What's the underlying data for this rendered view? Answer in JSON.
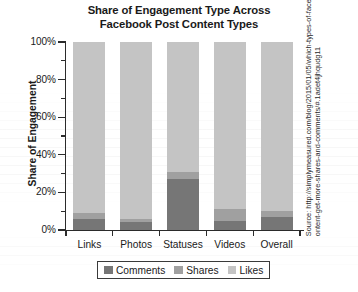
{
  "chart_data": {
    "type": "bar",
    "stacked": true,
    "title": "Share of Engagement Type Across Facebook Post Content Types",
    "title_lines": [
      "Share of Engagement Type Across",
      "Facebook Post Content Types"
    ],
    "xlabel": "",
    "ylabel": "Share of Engagement",
    "categories": [
      "Links",
      "Photos",
      "Statuses",
      "Videos",
      "Overall"
    ],
    "series": [
      {
        "name": "Comments",
        "color": "#767676",
        "values": [
          6,
          4,
          27,
          5,
          7
        ]
      },
      {
        "name": "Shares",
        "color": "#a0a0a0",
        "values": [
          3,
          2,
          4,
          6,
          3
        ]
      },
      {
        "name": "Likes",
        "color": "#c4c4c4",
        "values": [
          91,
          94,
          69,
          89,
          90
        ]
      }
    ],
    "ylim": [
      0,
      100
    ],
    "ytick_labels": [
      "0%",
      "20%",
      "40%",
      "60%",
      "80%",
      "100%"
    ],
    "ytick_values": [
      0,
      20,
      40,
      60,
      80,
      100
    ],
    "yminor_values": [
      10,
      30,
      50,
      70,
      90
    ],
    "grid": false,
    "legend_position": "bottom",
    "legend": [
      "Comments",
      "Shares",
      "Likes"
    ]
  },
  "source": {
    "text": "Source: http://simplymeasured.com/blog/2015/01/05/which-types-of-facebook-content-get-more-shares-and-comments/#.1adet4jhqudg11"
  },
  "colors": {
    "comments": "#767676",
    "shares": "#a0a0a0",
    "likes": "#c4c4c4",
    "axis": "#2b2b2b",
    "text": "#1a1a1a",
    "background": "#ffffff"
  }
}
